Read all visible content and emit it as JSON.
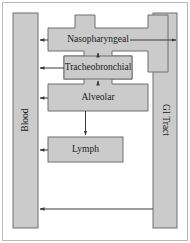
{
  "figure": {
    "type": "flow-diagram",
    "background_color": "#ffffff",
    "node_fill_color": "#cbcbcb",
    "node_stroke_color": "#6e6e6e",
    "arrow_color": "#3a3a3a",
    "frame_color": "#b9b9b9"
  },
  "nodes": {
    "blood": {
      "label": "Blood",
      "orientation": "vertical-up",
      "position": "left-column"
    },
    "gi_tract": {
      "label": "GI Tract",
      "orientation": "vertical-down",
      "position": "right-column"
    },
    "nasopharyngeal": {
      "label": "Nasopharyngeal",
      "orientation": "horizontal",
      "position": "row-1"
    },
    "tracheobronchial": {
      "label": "Tracheobronchial",
      "orientation": "horizontal",
      "position": "row-2"
    },
    "alveolar": {
      "label": "Alveolar",
      "orientation": "horizontal",
      "position": "row-3"
    },
    "lymph": {
      "label": "Lymph",
      "orientation": "horizontal",
      "position": "row-4"
    }
  },
  "edges": [
    {
      "id": "nasopharyngeal-to-blood",
      "from": "Nasopharyngeal",
      "to": "Blood",
      "direction": "left",
      "arrowhead": "end"
    },
    {
      "id": "nasopharyngeal-to-gi-tract",
      "from": "Nasopharyngeal",
      "to": "GI Tract",
      "direction": "right",
      "arrowhead": "end"
    },
    {
      "id": "tracheobronchial-to-blood",
      "from": "Tracheobronchial",
      "to": "Blood",
      "direction": "left",
      "arrowhead": "end"
    },
    {
      "id": "alveolar-to-blood",
      "from": "Alveolar",
      "to": "Blood",
      "direction": "left",
      "arrowhead": "end"
    },
    {
      "id": "lymph-to-blood",
      "from": "Lymph",
      "to": "Blood",
      "direction": "left",
      "arrowhead": "end"
    },
    {
      "id": "tracheobronchial-to-nasopharyngeal",
      "from": "Tracheobronchial",
      "to": "Nasopharyngeal",
      "direction": "up",
      "arrowhead": "end"
    },
    {
      "id": "alveolar-to-tracheobronchial",
      "from": "Alveolar",
      "to": "Tracheobronchial",
      "direction": "up",
      "arrowhead": "end"
    },
    {
      "id": "alveolar-to-lymph",
      "from": "Alveolar",
      "to": "Lymph",
      "direction": "down",
      "arrowhead": "end"
    },
    {
      "id": "gi-tract-to-blood",
      "from": "GI Tract",
      "to": "Blood",
      "direction": "left",
      "arrowhead": "end"
    }
  ]
}
